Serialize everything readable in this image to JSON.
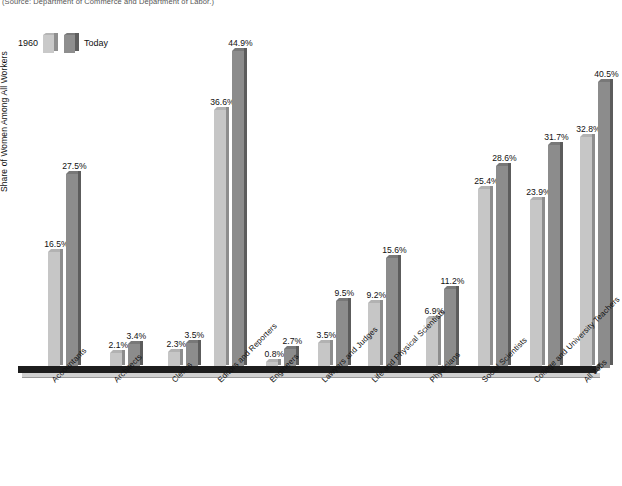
{
  "source_note": "(Source: Department of Commerce and Department of Labor.)",
  "legend": {
    "series_1_label": "1960",
    "series_2_label": "Today"
  },
  "axes": {
    "y_title": "Share of Women Among All Workers"
  },
  "colors": {
    "series_1960_face": "#c6c6c6",
    "series_1960_side": "#8d8d8d",
    "series_today_face": "#8c8c8c",
    "series_today_side": "#5c5c5c",
    "baseline": "#1d1d1d"
  },
  "chart_data": {
    "type": "bar",
    "title": "",
    "xlabel": "",
    "ylabel": "Share of Women Among All Workers",
    "ylim": [
      0,
      48
    ],
    "grid": false,
    "legend_position": "top-left",
    "value_suffix": "%",
    "categories": [
      "Accountants",
      "Architects",
      "Clerics",
      "Editors and Reporters",
      "Engineers",
      "Lawyers and Judges",
      "Life and Physical Scientists",
      "Physicians",
      "Social Scientists",
      "College and University Teachers",
      "All Jobs"
    ],
    "series": [
      {
        "name": "1960",
        "values": [
          16.5,
          2.1,
          2.3,
          36.6,
          0.8,
          3.5,
          9.2,
          6.9,
          25.4,
          23.9,
          32.8
        ],
        "labels": [
          "16.5%",
          "2.1%",
          "2.3%",
          "36.6%",
          "0.8%",
          "3.5%",
          "9.2%",
          "6.9%",
          "25.4%",
          "23.9%",
          "32.8%"
        ]
      },
      {
        "name": "Today",
        "values": [
          27.5,
          3.4,
          3.5,
          44.9,
          2.7,
          9.5,
          15.6,
          11.2,
          28.6,
          31.7,
          40.5
        ],
        "labels": [
          "27.5%",
          "3.4%",
          "3.5%",
          "44.9%",
          "2.7%",
          "9.5%",
          "15.6%",
          "11.2%",
          "28.6%",
          "31.7%",
          "40.5%"
        ]
      }
    ]
  }
}
